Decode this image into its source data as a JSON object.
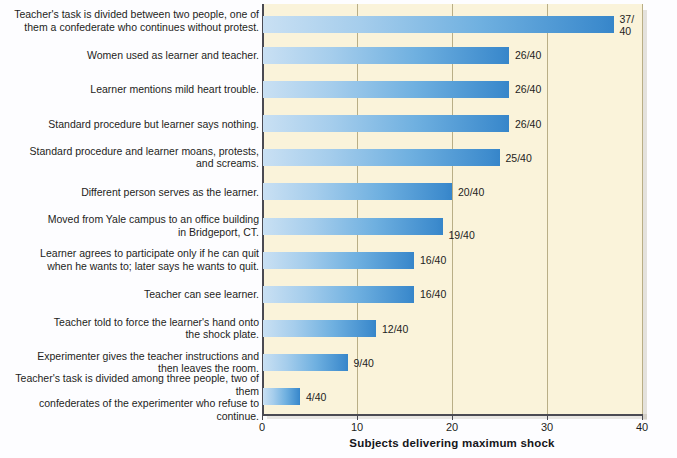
{
  "chart_data": {
    "type": "bar",
    "orientation": "horizontal",
    "title": "",
    "xlabel": "Subjects delivering maximum shock",
    "ylabel": "",
    "xlim": [
      0,
      40
    ],
    "xticks": [
      0,
      10,
      20,
      30,
      40
    ],
    "xtick_labels": [
      "0",
      "10",
      "20",
      "30",
      "40"
    ],
    "grid": true,
    "legend": false,
    "denominator": 40,
    "categories": [
      "Teacher's task is divided between two people, one of\nthem a confederate who continues without protest.",
      "Women used as learner and teacher.",
      "Learner mentions mild heart trouble.",
      "Standard procedure but learner says nothing.",
      "Standard procedure and learner moans, protests,\nand screams.",
      "Different person serves as the learner.",
      "Moved from Yale campus to an office building\nin Bridgeport, CT.",
      "Learner agrees to participate only if he can quit\nwhen he wants to; later says he wants to quit.",
      "Teacher can see learner.",
      "Teacher told to force the learner's hand onto\nthe shock plate.",
      "Experimenter gives the teacher instructions and\nthen leaves the room.",
      "Teacher's task is divided among three people, two of them\nconfederates of the experimenter who refuse to continue."
    ],
    "values": [
      37,
      26,
      26,
      26,
      25,
      20,
      19,
      16,
      16,
      12,
      9,
      4
    ],
    "value_labels": [
      "37/\n40",
      "26/40",
      "26/40",
      "26/40",
      "25/40",
      "20/40",
      "19/40",
      "16/40",
      "16/40",
      "12/40",
      "9/40",
      "4/40"
    ],
    "colors": {
      "bar_gradient_start": "#c9e0f3",
      "bar_gradient_end": "#3685c9",
      "panel_background": "#faf3da",
      "page_background": "#fdfdff",
      "gridline": "#b9ae86",
      "axis": "#4a4a52",
      "text": "#1d1d22"
    }
  }
}
